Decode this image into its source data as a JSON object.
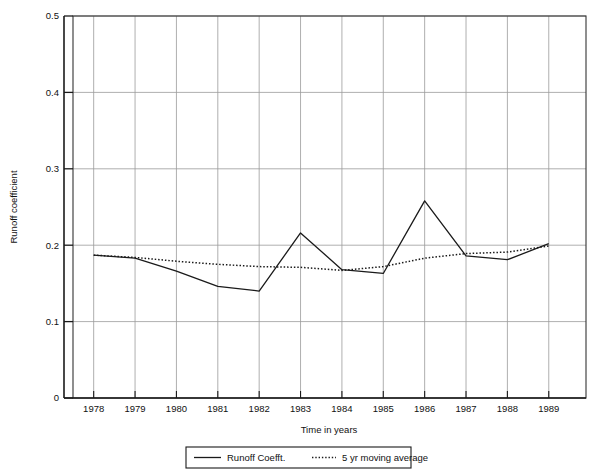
{
  "chart_data": {
    "type": "line",
    "title": "",
    "xlabel": "Time in years",
    "ylabel": "Runoff coefficient",
    "x": [
      1978,
      1979,
      1980,
      1981,
      1982,
      1983,
      1984,
      1985,
      1986,
      1987,
      1988,
      1989
    ],
    "xticklabels": [
      "1978",
      "1979",
      "1980",
      "1981",
      "1982",
      "1983",
      "1984",
      "1985",
      "1986",
      "1987",
      "1988",
      "1989"
    ],
    "yticklabels": [
      "0",
      "0.1",
      "0.2",
      "0.3",
      "0.4",
      "0.5"
    ],
    "yticks": [
      0,
      0.1,
      0.2,
      0.3,
      0.4,
      0.5
    ],
    "xlim": [
      1977.5,
      1989.9
    ],
    "ylim": [
      0,
      0.5
    ],
    "grid": true,
    "legend_position": "below-outside",
    "series": [
      {
        "name": "Runoff Coefft.",
        "style": "solid",
        "color": "#1a1a1a",
        "values": [
          0.187,
          0.183,
          0.166,
          0.146,
          0.14,
          0.216,
          0.168,
          0.163,
          0.258,
          0.186,
          0.181,
          0.202
        ]
      },
      {
        "name": "5 yr moving average",
        "style": "dotted",
        "color": "#1a1a1a",
        "values": [
          0.187,
          0.184,
          0.179,
          0.175,
          0.172,
          0.171,
          0.167,
          0.172,
          0.183,
          0.189,
          0.191,
          0.199
        ]
      }
    ]
  },
  "axes": {
    "y_title": "Runoff coefficient",
    "x_title": "Time in years"
  },
  "legend": {
    "items": [
      {
        "label": "Runoff Coefft.",
        "style": "solid"
      },
      {
        "label": "5 yr moving average",
        "style": "dotted"
      }
    ]
  }
}
